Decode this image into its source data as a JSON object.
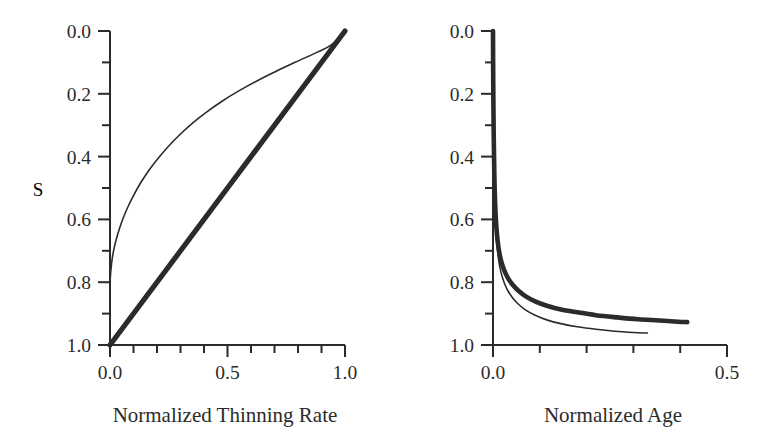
{
  "figure": {
    "background_color": "#ffffff",
    "line_color": "#2b2b2b",
    "width": 771,
    "height": 437
  },
  "chart_data": [
    {
      "panel": "left",
      "type": "line",
      "title": "",
      "xlabel": "Normalized Thinning Rate",
      "ylabel": "S",
      "xlim": [
        0.0,
        1.0
      ],
      "ylim": [
        0.0,
        1.0
      ],
      "y_axis_inverted": true,
      "grid": false,
      "legend": "none",
      "x_ticks_major": [
        "0.0",
        "0.5",
        "1.0"
      ],
      "x_ticks_major_values": [
        0.0,
        0.5,
        1.0
      ],
      "x_ticks_minor_values": [
        0.1,
        0.2,
        0.3,
        0.4,
        0.6,
        0.7,
        0.8,
        0.9
      ],
      "y_ticks_major": [
        "0.0",
        "0.2",
        "0.4",
        "0.6",
        "0.8",
        "1.0"
      ],
      "y_ticks_major_values": [
        0.0,
        0.2,
        0.4,
        0.6,
        0.8,
        1.0
      ],
      "y_ticks_minor_values": [
        0.1,
        0.3,
        0.5,
        0.7,
        0.9
      ],
      "series": [
        {
          "name": "thin-curve",
          "style": "thin",
          "stroke_width": 1.6,
          "x": [
            0.0,
            0.004,
            0.01,
            0.018,
            0.028,
            0.04,
            0.055,
            0.075,
            0.1,
            0.13,
            0.165,
            0.205,
            0.25,
            0.3,
            0.355,
            0.415,
            0.48,
            0.55,
            0.625,
            0.705,
            0.79,
            0.88,
            0.94,
            1.0
          ],
          "y": [
            0.8,
            0.76,
            0.722,
            0.69,
            0.66,
            0.63,
            0.598,
            0.562,
            0.524,
            0.484,
            0.444,
            0.405,
            0.366,
            0.328,
            0.291,
            0.256,
            0.222,
            0.19,
            0.159,
            0.129,
            0.099,
            0.068,
            0.045,
            0.0
          ]
        },
        {
          "name": "thick-line",
          "style": "thick",
          "stroke_width": 5.2,
          "x": [
            0.0,
            1.0
          ],
          "y": [
            1.0,
            0.0
          ]
        }
      ]
    },
    {
      "panel": "right",
      "type": "line",
      "title": "",
      "xlabel": "Normalized Age",
      "ylabel": "",
      "xlim": [
        0.0,
        0.5
      ],
      "ylim": [
        0.0,
        1.0
      ],
      "y_axis_inverted": true,
      "grid": false,
      "legend": "none",
      "x_ticks_major": [
        "0.0",
        "0.5"
      ],
      "x_ticks_major_values": [
        0.0,
        0.5
      ],
      "x_ticks_minor_values": [
        0.1,
        0.2,
        0.3,
        0.4
      ],
      "y_ticks_major": [
        "0.0",
        "0.2",
        "0.4",
        "0.6",
        "0.8",
        "1.0"
      ],
      "y_ticks_major_values": [
        0.0,
        0.2,
        0.4,
        0.6,
        0.8,
        1.0
      ],
      "y_ticks_minor_values": [
        0.1,
        0.3,
        0.5,
        0.7,
        0.9
      ],
      "series": [
        {
          "name": "thick-curve",
          "style": "thick",
          "stroke_width": 4.6,
          "x": [
            0.0,
            0.0005,
            0.0015,
            0.003,
            0.005,
            0.008,
            0.012,
            0.017,
            0.024,
            0.032,
            0.042,
            0.055,
            0.07,
            0.09,
            0.115,
            0.145,
            0.18,
            0.22,
            0.265,
            0.31,
            0.355,
            0.395,
            0.415
          ],
          "y": [
            0.0,
            0.16,
            0.33,
            0.47,
            0.565,
            0.64,
            0.692,
            0.73,
            0.762,
            0.787,
            0.808,
            0.828,
            0.845,
            0.861,
            0.875,
            0.887,
            0.896,
            0.905,
            0.912,
            0.918,
            0.922,
            0.926,
            0.927
          ]
        },
        {
          "name": "thin-curve",
          "style": "thin",
          "stroke_width": 1.6,
          "x": [
            0.0,
            0.0005,
            0.0015,
            0.003,
            0.005,
            0.008,
            0.012,
            0.017,
            0.024,
            0.032,
            0.042,
            0.055,
            0.07,
            0.09,
            0.115,
            0.145,
            0.18,
            0.22,
            0.26,
            0.3,
            0.33
          ],
          "y": [
            0.0,
            0.17,
            0.35,
            0.495,
            0.595,
            0.672,
            0.728,
            0.768,
            0.802,
            0.828,
            0.85,
            0.871,
            0.889,
            0.905,
            0.92,
            0.932,
            0.942,
            0.95,
            0.956,
            0.96,
            0.962
          ]
        }
      ]
    }
  ]
}
